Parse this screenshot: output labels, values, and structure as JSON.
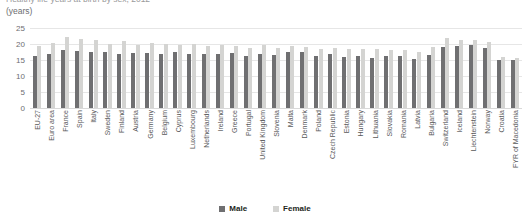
{
  "header": {
    "title_clipped": "Healthy life years at birth by sex, 2012",
    "unit_label": "(years)"
  },
  "legend": {
    "position": "bottom-center",
    "entries": [
      {
        "label": "Male",
        "color": "#6f6f71"
      },
      {
        "label": "Female",
        "color": "#d4d4d2"
      }
    ]
  },
  "axis": {
    "y_ticks": [
      "0",
      "5",
      "10",
      "15",
      "20",
      "25"
    ],
    "y_min": 0,
    "y_max": 25
  },
  "chart_data": {
    "type": "bar",
    "title": "Healthy life years at birth by sex, 2012",
    "xlabel": "",
    "ylabel": "(years)",
    "ylim": [
      0,
      25
    ],
    "grid": true,
    "legend_position": "bottom-center",
    "categories": [
      "EU-27",
      "Euro area",
      "France",
      "Spain",
      "Italy",
      "Sweden",
      "Finland",
      "Austria",
      "Germany",
      "Belgium",
      "Cyprus",
      "Luxembourg",
      "Netherlands",
      "Ireland",
      "Greece",
      "Portugal",
      "United Kingdom",
      "Slovenia",
      "Malta",
      "Denmark",
      "Poland",
      "Czech Republic",
      "Estonia",
      "Hungary",
      "Lithuania",
      "Slovakia",
      "Romania",
      "Latvia",
      "Bulgaria",
      "Switzerland",
      "Iceland",
      "Liechtenstein",
      "Norway",
      "Croatia",
      "FYR of Macedonia"
    ],
    "series": [
      {
        "name": "Male",
        "color": "#6f6f71",
        "values": [
          16.3,
          17.0,
          18.2,
          17.9,
          17.4,
          17.6,
          17.0,
          17.2,
          17.1,
          16.9,
          17.5,
          17.0,
          17.0,
          17.0,
          17.3,
          16.4,
          17.0,
          16.5,
          17.4,
          17.4,
          16.2,
          16.8,
          16.0,
          16.2,
          15.6,
          16.1,
          16.3,
          15.3,
          16.5,
          19.0,
          19.4,
          19.6,
          18.8,
          15.0,
          15.0
        ]
      },
      {
        "name": "Female",
        "color": "#d4d4d2",
        "values": [
          19.5,
          20.3,
          22.2,
          21.6,
          21.1,
          20.0,
          20.8,
          19.6,
          20.3,
          19.9,
          19.8,
          19.9,
          19.3,
          19.6,
          19.5,
          18.8,
          19.7,
          18.8,
          19.3,
          19.0,
          18.5,
          18.8,
          18.3,
          18.4,
          18.5,
          18.2,
          18.0,
          17.5,
          19.2,
          21.8,
          21.1,
          21.4,
          20.5,
          16.0,
          15.5
        ]
      }
    ]
  }
}
